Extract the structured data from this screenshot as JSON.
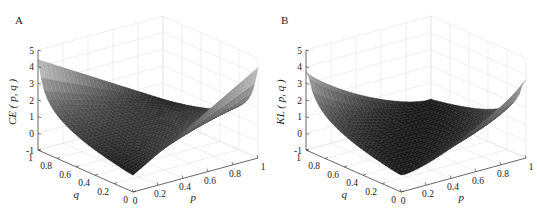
{
  "chart_data": [
    {
      "type": "surface3d",
      "panel_label": "A",
      "title": "",
      "zlabel": "CE ( p, q )",
      "xlabel": "p",
      "ylabel": "q",
      "x_ticks": [
        "0",
        "0.2",
        "0.4",
        "0.6",
        "0.8",
        "1"
      ],
      "y_ticks": [
        "0",
        "0.2",
        "0.4",
        "0.6",
        "0.8",
        "1"
      ],
      "z_ticks": [
        "-1",
        "0",
        "1",
        "2",
        "3",
        "4",
        "5"
      ],
      "xlim": [
        0,
        1
      ],
      "ylim": [
        0,
        1
      ],
      "zlim": [
        -1,
        5
      ],
      "grid": true,
      "function": "cross-entropy: -(p*ln(q) + (1-p)*ln(1-q))",
      "samples": {
        "corner_p0_q1": 4.4,
        "corner_p1_q0": 4.4,
        "corner_p0_q0": 0,
        "corner_p1_q1": 0,
        "min_value": 0
      },
      "colormap": "gray"
    },
    {
      "type": "surface3d",
      "panel_label": "B",
      "title": "",
      "zlabel": "KL ( p, q )",
      "xlabel": "p",
      "ylabel": "q",
      "x_ticks": [
        "0",
        "0.2",
        "0.4",
        "0.6",
        "0.8",
        "1"
      ],
      "y_ticks": [
        "0",
        "0.2",
        "0.4",
        "0.6",
        "0.8",
        "1"
      ],
      "z_ticks": [
        "-1",
        "0",
        "1",
        "2",
        "3",
        "4",
        "5"
      ],
      "xlim": [
        0,
        1
      ],
      "ylim": [
        0,
        1
      ],
      "zlim": [
        -1,
        5
      ],
      "grid": true,
      "function": "KL divergence: p*ln(p/q) + (1-p)*ln((1-p)/(1-q))",
      "samples": {
        "corner_p0_q1": 0,
        "corner_p1_q0": 3.7,
        "corner_p0_q0": 0,
        "corner_p1_q1": 0,
        "min_value": 0
      },
      "colormap": "gray"
    }
  ],
  "panels": {
    "a": {
      "label": "A",
      "zlabel": "CE ( p, q )",
      "xlabel": "p",
      "ylabel": "q"
    },
    "b": {
      "label": "B",
      "zlabel": "KL ( p, q )",
      "xlabel": "p",
      "ylabel": "q"
    }
  }
}
